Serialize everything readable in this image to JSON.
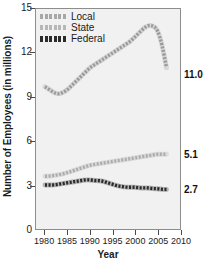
{
  "chart_data": {
    "type": "line",
    "title": "",
    "xlabel": "Year",
    "ylabel": "Number of Employees (in millions)",
    "xlim": [
      1978,
      2010
    ],
    "ylim": [
      0,
      15
    ],
    "xticks": [
      1980,
      1985,
      1990,
      1995,
      2000,
      2005,
      2010
    ],
    "xtick_labels": [
      "1980",
      "1985",
      "1990",
      "1995",
      "2000",
      "2005",
      "2010"
    ],
    "yticks": [
      0,
      3,
      6,
      9,
      12,
      15
    ],
    "ytick_labels": [
      "0",
      "3",
      "6",
      "9",
      "12",
      "15"
    ],
    "grid": false,
    "legend_position": "top-left",
    "series": [
      {
        "name": "Local",
        "color": "#9a9a9a",
        "marker": "dotted-thick",
        "end_label": "11.0",
        "x": [
          1980,
          1981,
          1982,
          1983,
          1984,
          1985,
          1986,
          1987,
          1988,
          1989,
          1990,
          1991,
          1992,
          1993,
          1994,
          1995,
          1996,
          1997,
          1998,
          1999,
          2000,
          2001,
          2002,
          2003,
          2004,
          2005,
          2006,
          2007
        ],
        "values": [
          9.7,
          9.5,
          9.3,
          9.2,
          9.3,
          9.5,
          9.8,
          10.1,
          10.4,
          10.7,
          11.0,
          11.2,
          11.4,
          11.6,
          11.8,
          12.0,
          12.2,
          12.4,
          12.6,
          12.8,
          13.1,
          13.4,
          13.7,
          13.9,
          13.85,
          13.6,
          12.6,
          11.0
        ]
      },
      {
        "name": "State",
        "color": "#adadad",
        "marker": "dotted-thick",
        "end_label": "5.1",
        "x": [
          1980,
          1981,
          1982,
          1983,
          1984,
          1985,
          1986,
          1987,
          1988,
          1989,
          1990,
          1991,
          1992,
          1993,
          1994,
          1995,
          1996,
          1997,
          1998,
          1999,
          2000,
          2001,
          2002,
          2003,
          2004,
          2005,
          2006,
          2007
        ],
        "values": [
          3.6,
          3.6,
          3.65,
          3.7,
          3.75,
          3.85,
          3.95,
          4.05,
          4.15,
          4.25,
          4.35,
          4.4,
          4.45,
          4.5,
          4.55,
          4.6,
          4.65,
          4.7,
          4.75,
          4.8,
          4.85,
          4.9,
          4.95,
          5.0,
          5.05,
          5.1,
          5.1,
          5.1
        ]
      },
      {
        "name": "Federal",
        "color": "#2b2b2b",
        "marker": "dotted-thick",
        "end_label": "2.7",
        "x": [
          1980,
          1981,
          1982,
          1983,
          1984,
          1985,
          1986,
          1987,
          1988,
          1989,
          1990,
          1991,
          1992,
          1993,
          1994,
          1995,
          1996,
          1997,
          1998,
          1999,
          2000,
          2001,
          2002,
          2003,
          2004,
          2005,
          2006,
          2007
        ],
        "values": [
          3.0,
          3.0,
          3.0,
          3.05,
          3.1,
          3.15,
          3.2,
          3.25,
          3.3,
          3.35,
          3.35,
          3.3,
          3.3,
          3.25,
          3.15,
          3.05,
          2.95,
          2.9,
          2.85,
          2.85,
          2.85,
          2.8,
          2.8,
          2.8,
          2.75,
          2.75,
          2.7,
          2.7
        ]
      }
    ]
  },
  "legend": {
    "items": [
      {
        "label": "Local"
      },
      {
        "label": "State"
      },
      {
        "label": "Federal"
      }
    ]
  }
}
